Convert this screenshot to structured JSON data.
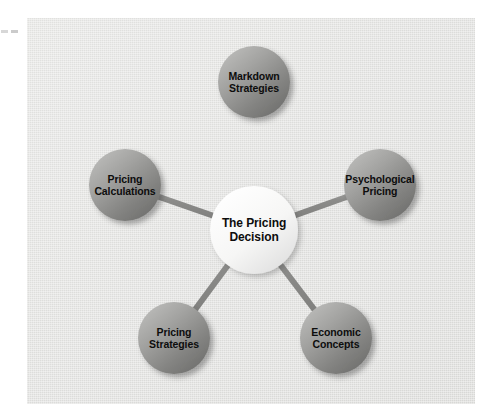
{
  "page": {
    "background_color": "#ffffff",
    "panel_color": "#e4e4e2"
  },
  "diagram": {
    "type": "hub-and-spoke",
    "title": "The Pricing Decision",
    "hub": {
      "label": "The Pricing\nDecision",
      "cx": 254,
      "cy": 230,
      "r": 44,
      "fill_light": "#fdfdfd",
      "fill_dark": "#e2e2e0",
      "text_color": "#0d0d0d"
    },
    "node_style": {
      "r": 36,
      "fill_light": "#b4b4b2",
      "fill_dark": "#6f6f6f",
      "text_color": "#0d0d0d"
    },
    "connector": {
      "color": "#8a8a88",
      "highlight_color": "#a9a9a7",
      "width": 6
    },
    "nodes": [
      {
        "id": "markdown-strategies",
        "label": "Markdown\nStrategies",
        "cx": 254,
        "cy": 82,
        "r": 36
      },
      {
        "id": "psychological-pricing",
        "label": "Psychological\nPricing",
        "cx": 380,
        "cy": 185,
        "r": 36
      },
      {
        "id": "economic-concepts",
        "label": "Economic\nConcepts",
        "cx": 336,
        "cy": 338,
        "r": 36
      },
      {
        "id": "pricing-strategies",
        "label": "Pricing\nStrategies",
        "cx": 174,
        "cy": 338,
        "r": 36
      },
      {
        "id": "pricing-calculations",
        "label": "Pricing\nCalculations",
        "cx": 125,
        "cy": 185,
        "r": 36
      }
    ]
  },
  "artifacts": {
    "edge_mark_color": "#c9c9c9"
  }
}
